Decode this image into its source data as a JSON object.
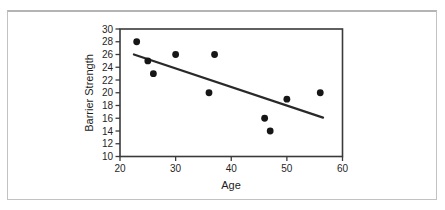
{
  "figure": {
    "background": "#ffffff",
    "border_color": "#c2c2c2"
  },
  "chart_data": {
    "type": "scatter",
    "title": "",
    "xlabel": "Age",
    "ylabel": "Barrier Strength",
    "xlim": [
      20,
      60
    ],
    "ylim": [
      10,
      30
    ],
    "xticks": [
      20,
      30,
      40,
      50,
      60
    ],
    "yticks": [
      10,
      12,
      14,
      16,
      18,
      20,
      22,
      24,
      26,
      28,
      30
    ],
    "grid": false,
    "legend": "none",
    "points": [
      {
        "x": 23,
        "y": 28
      },
      {
        "x": 25,
        "y": 25
      },
      {
        "x": 26,
        "y": 23
      },
      {
        "x": 30,
        "y": 26
      },
      {
        "x": 36,
        "y": 20
      },
      {
        "x": 37,
        "y": 26
      },
      {
        "x": 46,
        "y": 16
      },
      {
        "x": 47,
        "y": 14
      },
      {
        "x": 50,
        "y": 19
      },
      {
        "x": 56,
        "y": 20
      }
    ],
    "regression_line": {
      "x1": 22.5,
      "y1": 26.0,
      "x2": 56.5,
      "y2": 16.1
    },
    "point_color": "#161616",
    "line_color": "#292929",
    "axis_color": "#3a3a3a"
  }
}
